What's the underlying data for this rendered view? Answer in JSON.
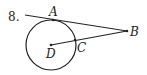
{
  "problem": {
    "number": "8.",
    "points": {
      "A": {
        "label": "A"
      },
      "B": {
        "label": "B"
      },
      "C": {
        "label": "C"
      },
      "D": {
        "label": "D"
      }
    }
  },
  "colors": {
    "stroke": "#222222",
    "background": "#ffffff"
  }
}
